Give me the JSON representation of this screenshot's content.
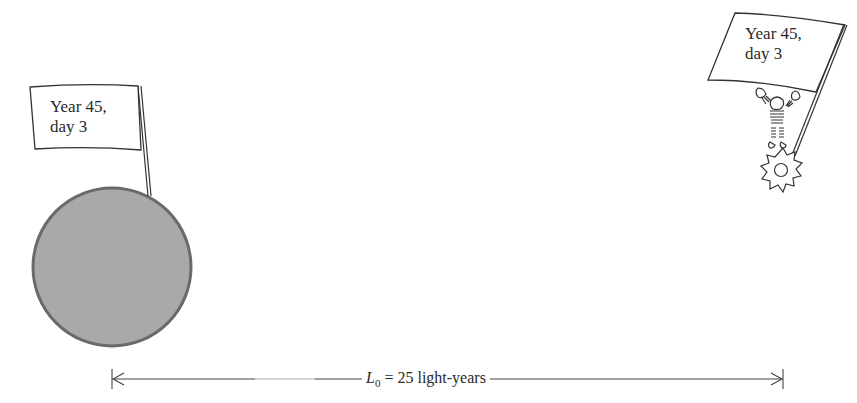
{
  "diagram": {
    "earth_flag": {
      "line1": "Year 45,",
      "line2": "day 3"
    },
    "star_flag": {
      "line1": "Year 45,",
      "line2": "day 3"
    },
    "dimension": {
      "symbol": "L",
      "subscript": "0",
      "equals": "=",
      "value": "25 light-years"
    },
    "colors": {
      "planet_fill": "#a9a9a9",
      "planet_stroke": "#6a6a6a",
      "line": "#444444"
    }
  }
}
